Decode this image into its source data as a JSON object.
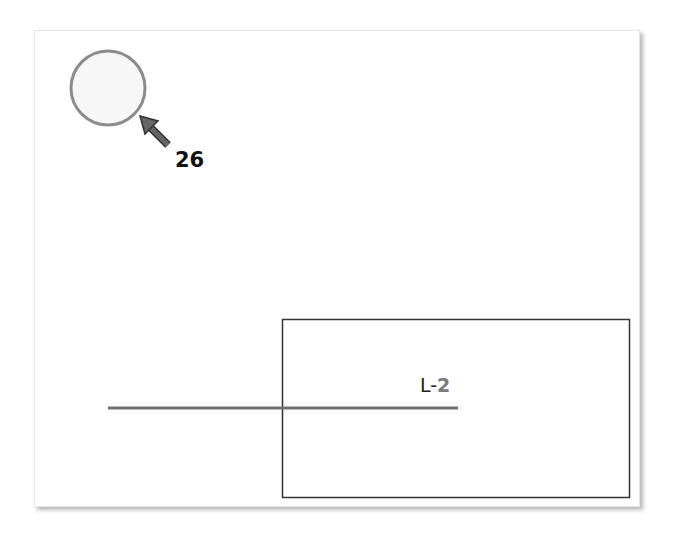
{
  "diagram": {
    "frame": {
      "background": "#ffffff",
      "border_color": "#e6e6e6"
    },
    "circle": {
      "cx": 108,
      "cy": 88,
      "r": 37,
      "fill": "#f7f7f7",
      "stroke": "#8c8c8c"
    },
    "callout": {
      "label": "26",
      "arrow_color": "#555555",
      "arrow_stroke": "#333333"
    },
    "rectangle": {
      "x": 282,
      "y": 319,
      "width": 347,
      "height": 178,
      "stroke": "#333333"
    },
    "line": {
      "x1": 108,
      "y1": 408,
      "x2": 458,
      "y2": 408,
      "stroke": "#707070",
      "label_prefix": "L-",
      "label_number": "2"
    }
  }
}
